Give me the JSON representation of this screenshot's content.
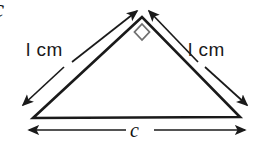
{
  "figure": {
    "background_color": "#ffffff",
    "stroke_color": "#1a1a1a",
    "corner_mark": {
      "text": "c",
      "name": "cut-off-letter-c"
    },
    "triangle": {
      "apex": {
        "x": 142,
        "y": 17
      },
      "bottom_left": {
        "x": 33,
        "y": 118
      },
      "bottom_right": {
        "x": 240,
        "y": 117
      },
      "right_angle_marker": {
        "at": "apex",
        "shape": "diamond",
        "size": 13
      }
    },
    "labels": {
      "leg_left": "l cm",
      "leg_right": "l cm",
      "base": "c"
    },
    "dimension_arrows": [
      {
        "name": "left-leg-arrow-to-apex",
        "from": {
          "x": 72,
          "y": 62
        },
        "to": {
          "x": 136,
          "y": 10
        },
        "heads": "end"
      },
      {
        "name": "left-leg-arrow-to-bottom-left",
        "from": {
          "x": 64,
          "y": 66
        },
        "to": {
          "x": 23,
          "y": 104
        },
        "heads": "end"
      },
      {
        "name": "right-leg-arrow-to-apex",
        "from": {
          "x": 199,
          "y": 62
        },
        "to": {
          "x": 150,
          "y": 10
        },
        "heads": "end"
      },
      {
        "name": "right-leg-arrow-to-bottom-right",
        "from": {
          "x": 205,
          "y": 66
        },
        "to": {
          "x": 247,
          "y": 104
        },
        "heads": "end"
      },
      {
        "name": "base-dimension-arrow",
        "from": {
          "x": 28,
          "y": 130
        },
        "to": {
          "x": 246,
          "y": 130
        },
        "heads": "both"
      }
    ]
  }
}
